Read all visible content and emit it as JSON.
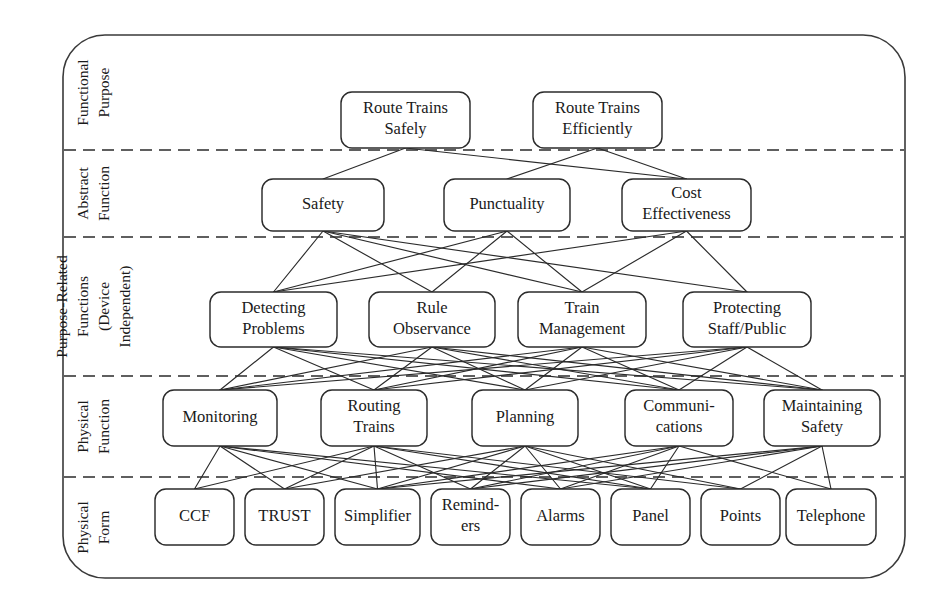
{
  "diagram": {
    "type": "abstraction-hierarchy",
    "frame": {
      "x": 63,
      "y": 35,
      "width": 842,
      "height": 543,
      "radius": 42
    },
    "levels": [
      {
        "id": "functional-purpose",
        "label": "Functional Purpose",
        "label_lines": [
          "Functional",
          "Purpose"
        ],
        "band_top": 35,
        "band_bottom": 150
      },
      {
        "id": "abstract-function",
        "label": "Abstract Function",
        "label_lines": [
          "Abstract",
          "Function"
        ],
        "band_top": 150,
        "band_bottom": 237
      },
      {
        "id": "purpose-related-functions",
        "label": "Purpose-Related Functions (Device Independent)",
        "label_lines": [
          "Purpose-Related",
          "Functions",
          "(Device",
          "Independent)"
        ],
        "band_top": 237,
        "band_bottom": 376
      },
      {
        "id": "physical-function",
        "label": "Physical Function",
        "label_lines": [
          "Physical",
          "Function"
        ],
        "band_top": 376,
        "band_bottom": 477
      },
      {
        "id": "physical-form",
        "label": "Physical Form",
        "label_lines": [
          "Physical",
          "Form"
        ],
        "band_top": 477,
        "band_bottom": 578
      }
    ],
    "dividers": [
      150,
      237,
      376,
      477
    ],
    "nodes": [
      {
        "id": "route-trains-safely",
        "level": "functional-purpose",
        "lines": [
          "Route Trains",
          "Safely"
        ],
        "x": 341,
        "y": 92,
        "w": 129,
        "h": 56,
        "font": 16.5
      },
      {
        "id": "route-trains-efficiently",
        "level": "functional-purpose",
        "lines": [
          "Route Trains",
          "Efficiently"
        ],
        "x": 533,
        "y": 92,
        "w": 129,
        "h": 56,
        "font": 16.5
      },
      {
        "id": "safety",
        "level": "abstract-function",
        "lines": [
          "Safety"
        ],
        "x": 262,
        "y": 179,
        "w": 122,
        "h": 52,
        "font": 16.5
      },
      {
        "id": "punctuality",
        "level": "abstract-function",
        "lines": [
          "Punctuality"
        ],
        "x": 444,
        "y": 179,
        "w": 126,
        "h": 52,
        "font": 16.5
      },
      {
        "id": "cost-effectiveness",
        "level": "abstract-function",
        "lines": [
          "Cost",
          "Effectiveness"
        ],
        "x": 622,
        "y": 179,
        "w": 129,
        "h": 52,
        "font": 16.5
      },
      {
        "id": "detecting-problems",
        "level": "purpose-related-functions",
        "lines": [
          "Detecting",
          "Problems"
        ],
        "x": 210,
        "y": 292,
        "w": 127,
        "h": 55,
        "font": 16.5
      },
      {
        "id": "rule-observance",
        "level": "purpose-related-functions",
        "lines": [
          "Rule",
          "Observance"
        ],
        "x": 369,
        "y": 292,
        "w": 126,
        "h": 55,
        "font": 16.5
      },
      {
        "id": "train-management",
        "level": "purpose-related-functions",
        "lines": [
          "Train",
          "Management"
        ],
        "x": 518,
        "y": 292,
        "w": 128,
        "h": 55,
        "font": 16.5
      },
      {
        "id": "protecting-staff-public",
        "level": "purpose-related-functions",
        "lines": [
          "Protecting",
          "Staff/Public"
        ],
        "x": 683,
        "y": 292,
        "w": 128,
        "h": 55,
        "font": 16.5
      },
      {
        "id": "monitoring",
        "level": "physical-function",
        "lines": [
          "Monitoring"
        ],
        "x": 163,
        "y": 390,
        "w": 114,
        "h": 56,
        "font": 16.5
      },
      {
        "id": "routing-trains",
        "level": "physical-function",
        "lines": [
          "Routing",
          "Trains"
        ],
        "x": 321,
        "y": 390,
        "w": 106,
        "h": 56,
        "font": 16.5
      },
      {
        "id": "planning",
        "level": "physical-function",
        "lines": [
          "Planning"
        ],
        "x": 472,
        "y": 390,
        "w": 106,
        "h": 56,
        "font": 16.5
      },
      {
        "id": "communications",
        "level": "physical-function",
        "lines": [
          "Communi-",
          "cations"
        ],
        "x": 625,
        "y": 390,
        "w": 108,
        "h": 56,
        "font": 16.5
      },
      {
        "id": "maintaining-safety",
        "level": "physical-function",
        "lines": [
          "Maintaining",
          "Safety"
        ],
        "x": 764,
        "y": 390,
        "w": 116,
        "h": 56,
        "font": 16.5
      },
      {
        "id": "ccf",
        "level": "physical-form",
        "lines": [
          "CCF"
        ],
        "x": 155,
        "y": 489,
        "w": 79,
        "h": 56,
        "font": 16.5
      },
      {
        "id": "trust",
        "level": "physical-form",
        "lines": [
          "TRUST"
        ],
        "x": 245,
        "y": 489,
        "w": 79,
        "h": 56,
        "font": 16.5
      },
      {
        "id": "simplifier",
        "level": "physical-form",
        "lines": [
          "Simplifier"
        ],
        "x": 335,
        "y": 489,
        "w": 85,
        "h": 56,
        "font": 16.5
      },
      {
        "id": "reminders",
        "level": "physical-form",
        "lines": [
          "Remind-",
          "ers"
        ],
        "x": 431,
        "y": 489,
        "w": 79,
        "h": 56,
        "font": 16.5
      },
      {
        "id": "alarms",
        "level": "physical-form",
        "lines": [
          "Alarms"
        ],
        "x": 521,
        "y": 489,
        "w": 79,
        "h": 56,
        "font": 16.5
      },
      {
        "id": "panel",
        "level": "physical-form",
        "lines": [
          "Panel"
        ],
        "x": 611,
        "y": 489,
        "w": 79,
        "h": 56,
        "font": 16.5
      },
      {
        "id": "points",
        "level": "physical-form",
        "lines": [
          "Points"
        ],
        "x": 701,
        "y": 489,
        "w": 79,
        "h": 56,
        "font": 16.5
      },
      {
        "id": "telephone",
        "level": "physical-form",
        "lines": [
          "Telephone"
        ],
        "x": 786,
        "y": 489,
        "w": 90,
        "h": 56,
        "font": 16.5
      }
    ],
    "edges": [
      [
        "route-trains-safely",
        "safety"
      ],
      [
        "route-trains-safely",
        "cost-effectiveness"
      ],
      [
        "route-trains-efficiently",
        "punctuality"
      ],
      [
        "route-trains-efficiently",
        "cost-effectiveness"
      ],
      [
        "safety",
        "detecting-problems"
      ],
      [
        "safety",
        "rule-observance"
      ],
      [
        "safety",
        "train-management"
      ],
      [
        "safety",
        "protecting-staff-public"
      ],
      [
        "punctuality",
        "detecting-problems"
      ],
      [
        "punctuality",
        "rule-observance"
      ],
      [
        "punctuality",
        "train-management"
      ],
      [
        "cost-effectiveness",
        "detecting-problems"
      ],
      [
        "cost-effectiveness",
        "train-management"
      ],
      [
        "cost-effectiveness",
        "protecting-staff-public"
      ],
      [
        "detecting-problems",
        "monitoring"
      ],
      [
        "detecting-problems",
        "routing-trains"
      ],
      [
        "detecting-problems",
        "planning"
      ],
      [
        "detecting-problems",
        "communications"
      ],
      [
        "detecting-problems",
        "maintaining-safety"
      ],
      [
        "rule-observance",
        "monitoring"
      ],
      [
        "rule-observance",
        "routing-trains"
      ],
      [
        "rule-observance",
        "planning"
      ],
      [
        "rule-observance",
        "communications"
      ],
      [
        "rule-observance",
        "maintaining-safety"
      ],
      [
        "train-management",
        "monitoring"
      ],
      [
        "train-management",
        "routing-trains"
      ],
      [
        "train-management",
        "planning"
      ],
      [
        "train-management",
        "communications"
      ],
      [
        "train-management",
        "maintaining-safety"
      ],
      [
        "protecting-staff-public",
        "monitoring"
      ],
      [
        "protecting-staff-public",
        "routing-trains"
      ],
      [
        "protecting-staff-public",
        "planning"
      ],
      [
        "protecting-staff-public",
        "communications"
      ],
      [
        "protecting-staff-public",
        "maintaining-safety"
      ],
      [
        "monitoring",
        "ccf"
      ],
      [
        "monitoring",
        "trust"
      ],
      [
        "monitoring",
        "simplifier"
      ],
      [
        "monitoring",
        "alarms"
      ],
      [
        "monitoring",
        "panel"
      ],
      [
        "routing-trains",
        "ccf"
      ],
      [
        "routing-trains",
        "trust"
      ],
      [
        "routing-trains",
        "simplifier"
      ],
      [
        "routing-trains",
        "reminders"
      ],
      [
        "routing-trains",
        "panel"
      ],
      [
        "routing-trains",
        "points"
      ],
      [
        "planning",
        "trust"
      ],
      [
        "planning",
        "simplifier"
      ],
      [
        "planning",
        "reminders"
      ],
      [
        "planning",
        "alarms"
      ],
      [
        "planning",
        "panel"
      ],
      [
        "planning",
        "points"
      ],
      [
        "communications",
        "simplifier"
      ],
      [
        "communications",
        "reminders"
      ],
      [
        "communications",
        "alarms"
      ],
      [
        "communications",
        "panel"
      ],
      [
        "communications",
        "telephone"
      ],
      [
        "maintaining-safety",
        "simplifier"
      ],
      [
        "maintaining-safety",
        "reminders"
      ],
      [
        "maintaining-safety",
        "alarms"
      ],
      [
        "maintaining-safety",
        "points"
      ],
      [
        "maintaining-safety",
        "telephone"
      ]
    ],
    "colors": {
      "background": "#ffffff",
      "node_fill": "#ffffff",
      "node_stroke": "#2b2b2b",
      "edge": "#2b2b2b",
      "frame": "#3a3a3a",
      "text": "#1a1a1a"
    }
  }
}
